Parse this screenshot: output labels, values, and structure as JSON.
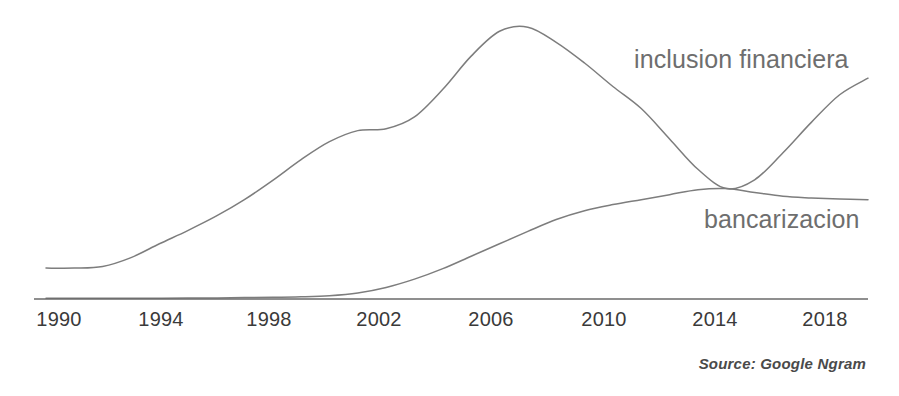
{
  "chart_data": {
    "type": "line",
    "title": "",
    "subtitle": "",
    "xlabel": "",
    "ylabel": "",
    "grid": false,
    "legend_position": "inline-right-end-of-line",
    "source_note": "Source: Google Ngram",
    "axis": {
      "x_ticks": [
        "1990",
        "1994",
        "1998",
        "2002",
        "2006",
        "2010",
        "2014",
        "2018"
      ],
      "x_tick_values": [
        1990,
        1994,
        1998,
        2002,
        2006,
        2010,
        2014,
        2018
      ],
      "xlim": [
        1990,
        2019
      ],
      "ylim": [
        0,
        1.0
      ],
      "y_axis_visible": false,
      "y_ticks": []
    },
    "x": [
      1990,
      1991,
      1992,
      1993,
      1994,
      1995,
      1996,
      1997,
      1998,
      1999,
      2000,
      2001,
      2002,
      2003,
      2004,
      2005,
      2006,
      2007,
      2008,
      2009,
      2010,
      2011,
      2012,
      2013,
      2014,
      2015,
      2016,
      2017,
      2018,
      2019
    ],
    "series": [
      {
        "name": "inclusion financiera",
        "label": "inclusion financiera",
        "color": "#7d7d7d",
        "values": [
          0.112,
          0.112,
          0.118,
          0.15,
          0.2,
          0.248,
          0.3,
          0.36,
          0.43,
          0.505,
          0.57,
          0.61,
          0.617,
          0.66,
          0.76,
          0.88,
          0.97,
          0.985,
          0.93,
          0.855,
          0.77,
          0.69,
          0.58,
          0.47,
          0.4,
          0.432,
          0.53,
          0.64,
          0.74,
          0.8
        ]
      },
      {
        "name": "bancarizacion",
        "label": "bancarizacion",
        "color": "#7d7d7d",
        "values": [
          0.003,
          0.003,
          0.003,
          0.003,
          0.003,
          0.004,
          0.004,
          0.005,
          0.006,
          0.008,
          0.012,
          0.022,
          0.042,
          0.072,
          0.11,
          0.155,
          0.2,
          0.245,
          0.288,
          0.32,
          0.342,
          0.36,
          0.378,
          0.396,
          0.4,
          0.386,
          0.372,
          0.366,
          0.362,
          0.36
        ]
      }
    ]
  },
  "labels": {
    "inclusion_financiera": "inclusion financiera",
    "bancarizacion": "bancarizacion",
    "source": "Source: Google Ngram"
  },
  "ticks": {
    "t0": "1990",
    "t1": "1994",
    "t2": "1998",
    "t3": "2002",
    "t4": "2006",
    "t5": "2010",
    "t6": "2014",
    "t7": "2018"
  },
  "colors": {
    "line": "#7d7d7d",
    "axis": "#6a6a6a",
    "tick_text": "#3a3a3a",
    "label_text": "#6e6e6e",
    "source_text": "#4a4a4a",
    "background": "#ffffff"
  }
}
